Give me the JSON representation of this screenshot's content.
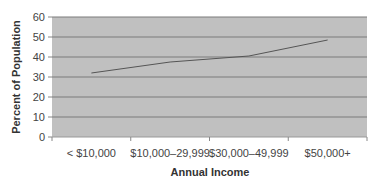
{
  "chart_data": {
    "type": "line",
    "title": "",
    "xlabel": "Annual Income",
    "ylabel": "Percent of Population",
    "categories": [
      "< $10,000",
      "$10,000–29,999",
      "$30,000–49,999",
      "$50,000+"
    ],
    "series": [
      {
        "name": "Percent of Population",
        "values": [
          32,
          37.5,
          40.5,
          48.5
        ]
      }
    ],
    "ylim": [
      0,
      60
    ],
    "yticks": [
      0,
      10,
      20,
      30,
      40,
      50,
      60
    ],
    "grid": true,
    "legend": "none",
    "colors": {
      "plot_background": "#c0c0c0",
      "gridline": "#7a7a7a",
      "line": "#555555"
    }
  }
}
